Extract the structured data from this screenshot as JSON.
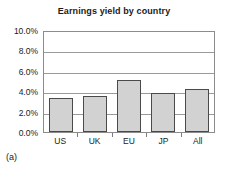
{
  "caption": "(a)",
  "chart_data": {
    "type": "bar",
    "title": "Earnings yield by country",
    "xlabel": "",
    "ylabel": "",
    "categories": [
      "US",
      "UK",
      "EU",
      "JP",
      "All"
    ],
    "values": [
      3.35,
      3.55,
      5.1,
      3.8,
      4.2
    ],
    "value_labels": [
      "3.35%",
      "3.55%",
      "5.1%",
      "3.8%",
      "4.2%"
    ],
    "ylim": [
      0.0,
      10.0
    ],
    "ytick_values": [
      10.0,
      8.0,
      6.0,
      4.0,
      2.0,
      0.0
    ],
    "ytick_labels": [
      "10.0%",
      "8.0%",
      "6.0%",
      "4.0%",
      "2.0%",
      "0.0%"
    ],
    "grid": true,
    "legend": false,
    "bar_fill": "#d2d2d2",
    "bar_border": "#4a4a4a",
    "grid_color": "#9a9a9a",
    "frame_color": "#8c8c8c"
  }
}
